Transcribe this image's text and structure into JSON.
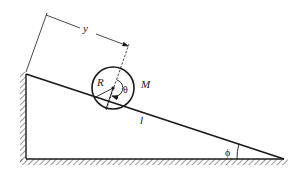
{
  "diagram": {
    "colors": {
      "ink": "#1a1a1a",
      "background": "#ffffff"
    },
    "labels": {
      "distance": "y",
      "radius": "R",
      "rotation_angle": "θ",
      "mass": "M",
      "incline_length": "l",
      "incline_angle": "ϕ"
    },
    "geometry": {
      "incline_top": [
        26,
        74
      ],
      "incline_bottom_left": [
        26,
        159
      ],
      "incline_bottom_right": [
        282,
        159
      ],
      "cylinder_center": [
        113,
        88
      ],
      "cylinder_radius": 21
    }
  }
}
